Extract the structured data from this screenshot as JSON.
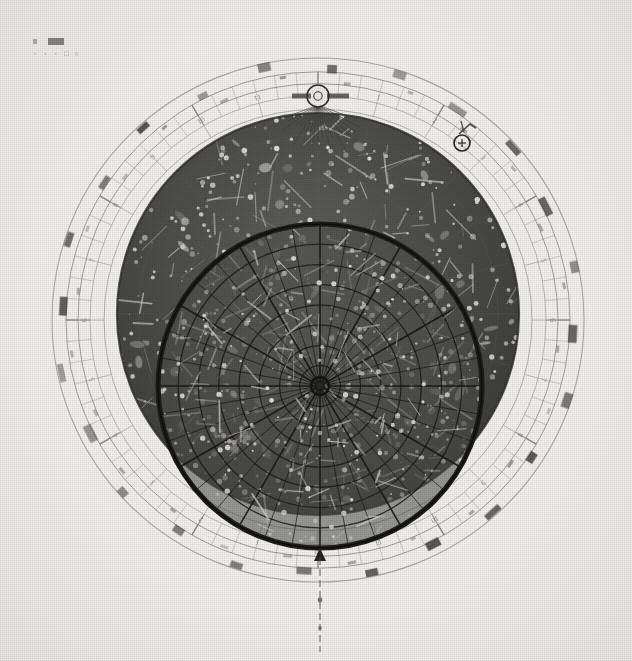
{
  "plate": {
    "title": "Planisphere star finder (photographic plate)",
    "background_color": "#f4f3f0",
    "ink_color": "#2a2a28",
    "disc_color": "#4a4a48",
    "width": 632,
    "height": 661
  },
  "corner": {
    "catalog_mark": "▪▬",
    "catalog_code": "· · · □ ○"
  },
  "star_disc": {
    "name": "star-disc",
    "center_x": 318,
    "center_y": 314,
    "radius": 201,
    "label": "Rotating star map disc"
  },
  "horizon_circle": {
    "name": "horizon-circle",
    "center_x": 320,
    "center_y": 386,
    "radius": 162,
    "label": "Horizon mask / local sky window"
  },
  "zenith": {
    "name": "zenith-point",
    "center_x": 320,
    "center_y": 386,
    "label": "Zenith"
  },
  "index_circle": {
    "name": "index-circle",
    "center_x": 318,
    "center_y": 96,
    "radius": 11,
    "ray_count": 19,
    "label": "North celestial pole index"
  },
  "date_marker": {
    "name": "date-marker",
    "center_x": 462,
    "center_y": 143,
    "radius": 8,
    "glyph": "⊕",
    "label": "Sun / date cursor"
  },
  "south_pointer": {
    "name": "south-pointer",
    "x": 320,
    "y_top": 548,
    "y_bottom": 652,
    "label": "South meridian pointer"
  },
  "rings": [
    {
      "name": "outer-rim-ring",
      "radius": 266,
      "stroke": "#9a9a97",
      "width": 1.1
    },
    {
      "name": "calendar-scale-ring",
      "radius": 252,
      "stroke": "#8c8c89",
      "width": 1.0
    },
    {
      "name": "zodiac-scale-ring",
      "radius": 240,
      "stroke": "#8c8c89",
      "width": 1.0
    },
    {
      "name": "hour-scale-ring",
      "radius": 228,
      "stroke": "#a3a3a0",
      "width": 0.9
    },
    {
      "name": "inner-rim-ring",
      "radius": 214,
      "stroke": "#9a9a97",
      "width": 0.9
    }
  ],
  "scales": {
    "calendar": {
      "name": "calendar-scale",
      "label": "Calendar / month scale",
      "major_ticks": 12,
      "minor_ticks": 72,
      "labels": [
        "I",
        "II",
        "III",
        "IV",
        "V",
        "VI",
        "VII",
        "VIII",
        "IX",
        "X",
        "XI",
        "XII"
      ]
    },
    "hours": {
      "name": "hour-scale",
      "label": "Hour scale",
      "divisions": 24,
      "labels": [
        "12",
        "1",
        "2",
        "3",
        "4",
        "5",
        "6",
        "7",
        "8",
        "9",
        "10",
        "11",
        "12",
        "1",
        "2",
        "3",
        "4",
        "5",
        "6",
        "7",
        "8",
        "9",
        "10",
        "11"
      ]
    },
    "degrees": {
      "name": "degree-scale",
      "label": "Degree scale",
      "divisions": 72,
      "step_degrees": 5
    }
  },
  "month_blocks": {
    "name": "month-label-blocks",
    "count": 24,
    "description": "Dark rectangular month / zodiac name blocks around outer ring"
  },
  "horizon_grid": {
    "name": "horizon-coordinate-grid",
    "azimuth_lines": 36,
    "almucantar_circles": 8,
    "label": "Azimuth and altitude net"
  },
  "star_field": {
    "name": "star-field",
    "star_count": 420,
    "constellation_line_count": 150,
    "label": "Stars and constellation figures"
  },
  "meridian": {
    "name": "meridian-line",
    "label": "Local meridian"
  }
}
